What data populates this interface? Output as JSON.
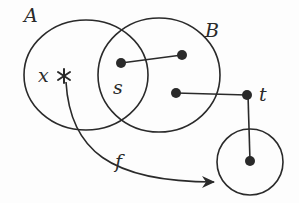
{
  "diagram": {
    "type": "set-mapping",
    "colors": {
      "stroke": "#2a2a2a",
      "dot": "#2a2a2a",
      "background": "#fdfdfd"
    },
    "sets": [
      {
        "id": "A",
        "label": "A",
        "cx": 86,
        "cy": 75,
        "rx": 62,
        "ry": 55,
        "label_x": 24,
        "label_y": 22
      },
      {
        "id": "B",
        "label": "B",
        "cx": 159,
        "cy": 75,
        "rx": 61,
        "ry": 57,
        "label_x": 205,
        "label_y": 37
      },
      {
        "id": "target",
        "label": "",
        "cx": 250,
        "cy": 162,
        "rx": 33,
        "ry": 33
      }
    ],
    "points": [
      {
        "id": "x",
        "label": "x",
        "kind": "asterisk",
        "x": 64,
        "y": 76,
        "label_x": 38,
        "label_y": 82
      },
      {
        "id": "s",
        "label": "s",
        "kind": "dot",
        "x": 121,
        "y": 63,
        "label_x": 113,
        "label_y": 94
      },
      {
        "id": "p1",
        "label": "",
        "kind": "dot",
        "x": 182,
        "y": 55
      },
      {
        "id": "p2",
        "label": "",
        "kind": "dot",
        "x": 176,
        "y": 93
      },
      {
        "id": "t",
        "label": "t",
        "kind": "dot",
        "x": 247,
        "y": 95,
        "label_x": 259,
        "label_y": 101
      },
      {
        "id": "fx",
        "label": "",
        "kind": "dot",
        "x": 250,
        "y": 161
      }
    ],
    "segments": [
      {
        "from": "s",
        "to": "p1"
      },
      {
        "from": "p2",
        "to": "t"
      },
      {
        "from": "t",
        "to": "fx"
      }
    ],
    "arrow": {
      "label": "f",
      "from": "x",
      "label_x": 115,
      "label_y": 168
    }
  }
}
